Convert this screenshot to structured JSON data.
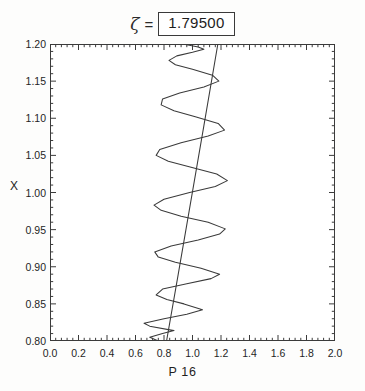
{
  "title": {
    "symbol": "ζ",
    "equals": "=",
    "value": "1.79500"
  },
  "axis_titles": {
    "x": "P 16",
    "y": "X"
  },
  "chart_data": {
    "type": "line",
    "title": "ζ = 1.79500",
    "xlabel": "P 16",
    "ylabel": "X",
    "xlim": [
      0.0,
      2.0
    ],
    "ylim": [
      0.8,
      1.2
    ],
    "xticks": [
      0.0,
      0.2,
      0.4,
      0.6,
      0.8,
      1.0,
      1.2,
      1.4,
      1.6,
      1.8,
      2.0
    ],
    "xtick_labels": [
      "0.0",
      "0.2",
      "0.4",
      "0.6",
      "0.8",
      "1.0",
      "1.2",
      "1.4",
      "1.6",
      "1.8",
      "2.0"
    ],
    "yticks": [
      0.8,
      0.85,
      0.9,
      0.95,
      1.0,
      1.05,
      1.1,
      1.15,
      1.2
    ],
    "ytick_labels": [
      "0.80",
      "0.85",
      "0.90",
      "0.95",
      "1.00",
      "1.05",
      "1.10",
      "1.15",
      "1.20"
    ],
    "minor_ticks_per_major_x": 5,
    "minor_ticks_per_major_y": 5,
    "grid": false,
    "legend": "none",
    "orientation": "vertical-independent",
    "series": [
      {
        "name": "reference-line",
        "type": "line",
        "comment": "near-straight line, x increases with X",
        "points": [
          [
            0.818,
            0.8
          ],
          [
            0.9,
            0.89
          ],
          [
            0.99,
            0.99
          ],
          [
            1.08,
            1.09
          ],
          [
            1.178,
            1.2
          ]
        ]
      },
      {
        "name": "oscillating-curve",
        "type": "line",
        "comment": "damped oscillation about the reference line; amplitude grows from X=0.80 toward X~1.02 then decays near X=1.20",
        "points": [
          [
            0.76,
            0.8
          ],
          [
            0.7,
            0.805
          ],
          [
            0.79,
            0.81
          ],
          [
            0.87,
            0.814
          ],
          [
            0.7,
            0.82
          ],
          [
            0.66,
            0.824
          ],
          [
            0.8,
            0.83
          ],
          [
            0.96,
            0.836
          ],
          [
            1.07,
            0.842
          ],
          [
            0.94,
            0.85
          ],
          [
            0.82,
            0.856
          ],
          [
            0.745,
            0.862
          ],
          [
            0.79,
            0.87
          ],
          [
            0.96,
            0.877
          ],
          [
            1.13,
            0.884
          ],
          [
            1.19,
            0.89
          ],
          [
            1.06,
            0.898
          ],
          [
            0.88,
            0.906
          ],
          [
            0.76,
            0.913
          ],
          [
            0.735,
            0.92
          ],
          [
            0.85,
            0.928
          ],
          [
            1.04,
            0.936
          ],
          [
            1.19,
            0.944
          ],
          [
            1.23,
            0.951
          ],
          [
            1.11,
            0.96
          ],
          [
            0.92,
            0.968
          ],
          [
            0.78,
            0.976
          ],
          [
            0.73,
            0.983
          ],
          [
            0.8,
            0.991
          ],
          [
            0.98,
            1.0
          ],
          [
            1.16,
            1.008
          ],
          [
            1.245,
            1.016
          ],
          [
            1.17,
            1.025
          ],
          [
            0.99,
            1.034
          ],
          [
            0.83,
            1.042
          ],
          [
            0.745,
            1.05
          ],
          [
            0.77,
            1.058
          ],
          [
            0.92,
            1.067
          ],
          [
            1.11,
            1.076
          ],
          [
            1.225,
            1.084
          ],
          [
            1.18,
            1.093
          ],
          [
            1.02,
            1.102
          ],
          [
            0.87,
            1.11
          ],
          [
            0.78,
            1.118
          ],
          [
            0.79,
            1.126
          ],
          [
            0.91,
            1.134
          ],
          [
            1.08,
            1.142
          ],
          [
            1.185,
            1.15
          ],
          [
            1.14,
            1.158
          ],
          [
            1.0,
            1.166
          ],
          [
            0.88,
            1.172
          ],
          [
            0.835,
            1.178
          ],
          [
            0.89,
            1.184
          ],
          [
            1.0,
            1.189
          ],
          [
            1.08,
            1.193
          ],
          [
            1.04,
            1.196
          ],
          [
            0.96,
            1.199
          ],
          [
            0.93,
            1.2
          ]
        ]
      }
    ]
  }
}
